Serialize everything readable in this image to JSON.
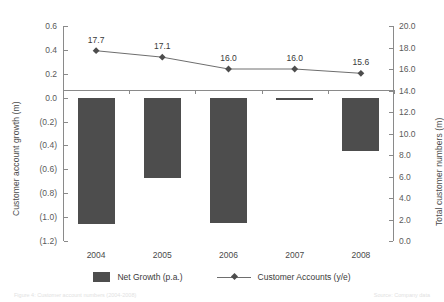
{
  "chart_data": {
    "type": "bar",
    "title": "",
    "categories": [
      "2004",
      "2005",
      "2006",
      "2007",
      "2008"
    ],
    "xlabel": "",
    "grid": false,
    "legend_position": "bottom",
    "series": [
      {
        "name": "Net Growth (p.a.)",
        "type": "bar",
        "axis": "left",
        "values": [
          -1.06,
          -0.67,
          -1.05,
          -0.02,
          -0.45
        ],
        "color": "#4d4d4d"
      },
      {
        "name": "Customer Accounts (y/e)",
        "type": "line",
        "axis": "right",
        "values": [
          17.7,
          17.1,
          16.0,
          16.0,
          15.6
        ],
        "labels": [
          "17.7",
          "17.1",
          "16.0",
          "16.0",
          "15.6"
        ],
        "color": "#6e6e6e"
      }
    ],
    "left_axis": {
      "label": "Customer account growth (m)",
      "ylim": [
        -1.2,
        0.6
      ],
      "ticks": [
        0.6,
        0.4,
        0.2,
        0.0,
        -0.2,
        -0.4,
        -0.6,
        -0.8,
        -1.0,
        -1.2
      ],
      "tick_labels": [
        "0.6",
        "0.4",
        "0.2",
        "0.0",
        "(0.2)",
        "(0.4)",
        "(0.6)",
        "(0.8)",
        "(1.0)",
        "(1.2)"
      ]
    },
    "right_axis": {
      "label": "Total customer numbers (m)",
      "ylim": [
        0.0,
        20.0
      ],
      "ticks": [
        20.0,
        18.0,
        16.0,
        14.0,
        12.0,
        10.0,
        8.0,
        6.0,
        4.0,
        2.0,
        0.0
      ],
      "tick_labels": [
        "20.0",
        "18.0",
        "16.0",
        "14.0",
        "12.0",
        "10.0",
        "8.0",
        "6.0",
        "4.0",
        "2.0",
        "0.0"
      ]
    }
  },
  "legend": {
    "items": [
      {
        "label": "Net Growth (p.a.)"
      },
      {
        "label": "Customer Accounts (y/e)"
      }
    ]
  },
  "caption": {
    "left": "Figure 4: Customer account numbers (2004-2008)",
    "right": "Source: Company data"
  }
}
